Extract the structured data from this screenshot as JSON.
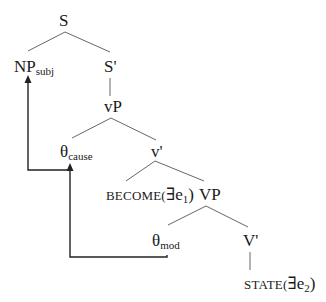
{
  "diagram": {
    "type": "syntax-tree",
    "nodes": {
      "s": {
        "label": "S"
      },
      "np_subj": {
        "label": "NP",
        "sub": "subj"
      },
      "s_bar": {
        "label": "S'"
      },
      "vp_little": {
        "label": "vP"
      },
      "theta_cause": {
        "label": "θ",
        "sub": "cause"
      },
      "v_bar": {
        "label": "v'"
      },
      "become": {
        "label": "BECOME(",
        "exists": "∃",
        "var": "e",
        "sub": "1",
        "close": ")"
      },
      "vp_big": {
        "label": "VP"
      },
      "theta_mod": {
        "label": "θ",
        "sub": "mod"
      },
      "v_bar_big": {
        "label": "V'"
      },
      "state": {
        "label": "STATE(",
        "exists": "∃",
        "var": "e",
        "sub": "2",
        "close": ")"
      }
    },
    "edges": [
      [
        "S",
        "NPsubj"
      ],
      [
        "S",
        "S'"
      ],
      [
        "S'",
        "vP"
      ],
      [
        "vP",
        "θcause"
      ],
      [
        "vP",
        "v'"
      ],
      [
        "v'",
        "BECOME(∃e1)"
      ],
      [
        "v'",
        "VP"
      ],
      [
        "VP",
        "θmod"
      ],
      [
        "VP",
        "V'"
      ],
      [
        "V'",
        "STATE(∃e2)"
      ]
    ],
    "movement_arrows": [
      {
        "from": "θmod",
        "to": "θcause"
      },
      {
        "from": "θcause",
        "to": "NPsubj"
      }
    ],
    "line_color": "#555555",
    "arrow_color": "#222222"
  }
}
